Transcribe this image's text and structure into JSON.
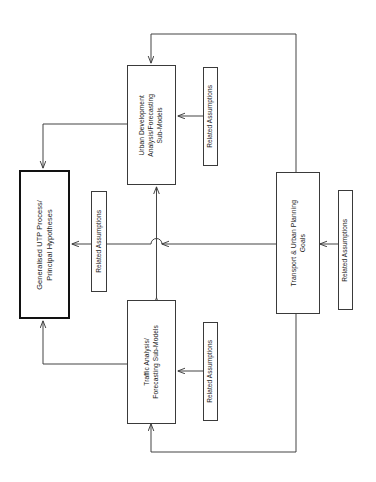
{
  "diagram": {
    "orientation": "rotated-90-ccw",
    "stroke_color": "#3a3a3a",
    "primary_stroke_color": "#121212",
    "background": "#ffffff",
    "nodes": [
      {
        "id": "utp-process",
        "label": "Generalised UTP Process/\nPrincipal Hypotheses",
        "line1": "Generalised UTP Process/",
        "line2": "Principal Hypotheses",
        "emphasis": "bold-outline"
      },
      {
        "id": "urban-development",
        "label": "Urban Development Analysis/Forecasting Sub-Models",
        "line1": "Urban Development",
        "line2": "Analysis/Forecasting",
        "line3": "Sub-Models",
        "emphasis": "normal"
      },
      {
        "id": "traffic-analysis",
        "label": "Traffic Analysis/ Forecasting Sub-Models",
        "line1": "Traffic Analysis/",
        "line2": "Forecasting Sub-Models",
        "emphasis": "normal"
      },
      {
        "id": "transport-goals",
        "label": "Transport & Urban Planning Goals",
        "line1": "Transport & Urban Planning",
        "line2": "Goals",
        "emphasis": "normal"
      }
    ],
    "assumptions": [
      {
        "id": "assumption-urban-development",
        "label": "Related Assumptions",
        "targets": "urban-development"
      },
      {
        "id": "assumption-utp-process",
        "label": "Related Assumptions",
        "targets": "utp-process"
      },
      {
        "id": "assumption-traffic-analysis",
        "label": "Related Assumptions",
        "targets": "traffic-analysis"
      },
      {
        "id": "assumption-transport-goals",
        "label": "Related Assumptions",
        "targets": "transport-goals"
      }
    ],
    "connectors": [
      {
        "id": "goals-to-utp",
        "from": "transport-goals",
        "to": "utp-process",
        "style": "line-hop-over-vertical"
      },
      {
        "id": "urban-dev-to-utp",
        "from": "urban-development",
        "to": "utp-process"
      },
      {
        "id": "traffic-to-utp",
        "from": "traffic-analysis",
        "to": "utp-process"
      },
      {
        "id": "urban-dev-traffic-link",
        "from": "urban-development",
        "to": "traffic-analysis",
        "style": "double-headed"
      },
      {
        "id": "goals-feedback-top",
        "from": "transport-goals",
        "to": "urban-development"
      },
      {
        "id": "goals-feedback-bottom",
        "from": "transport-goals",
        "to": "traffic-analysis"
      }
    ]
  }
}
